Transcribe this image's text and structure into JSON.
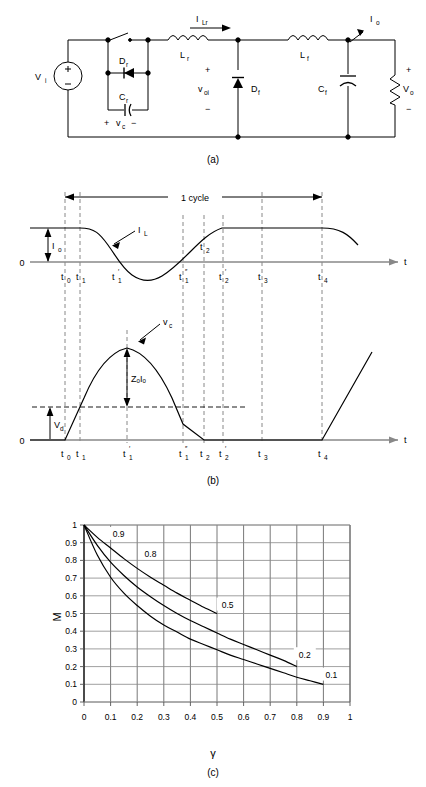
{
  "figure": {
    "panels": [
      {
        "id": "a",
        "caption": "(a)",
        "description": "circuit-schematic"
      },
      {
        "id": "b",
        "caption": "(b)",
        "description": "waveform-timing-diagram"
      },
      {
        "id": "c",
        "caption": "(c)",
        "description": "conversion-ratio-chart"
      }
    ]
  },
  "circuit": {
    "source_label": "Vᵢ",
    "switch_name": "switch",
    "components": [
      {
        "name": "Dᵣ",
        "label": "D",
        "sub": "r",
        "type": "diode"
      },
      {
        "name": "Cᵣ",
        "label": "C",
        "sub": "r",
        "type": "capacitor"
      },
      {
        "name": "Lᵣ",
        "label": "L",
        "sub": "r",
        "type": "inductor"
      },
      {
        "name": "Lғ",
        "label": "L",
        "sub": "f",
        "type": "inductor"
      },
      {
        "name": "Dғ",
        "label": "D",
        "sub": "f",
        "type": "diode"
      },
      {
        "name": "Cғ",
        "label": "C",
        "sub": "f",
        "type": "capacitor"
      }
    ],
    "labels": {
      "vi": "V",
      "vi_sub": "i",
      "dr": "D",
      "dr_sub": "r",
      "cr": "C",
      "cr_sub": "r",
      "vc_plus": "+",
      "vc": "v",
      "vc_sub": "c",
      "vc_minus": "−",
      "ilr": "I",
      "ilr_sub": "Lr",
      "lr": "L",
      "lr_sub": "r",
      "lf": "L",
      "lf_sub": "f",
      "voi": "v",
      "voi_sub": "oi",
      "df": "D",
      "df_sub": "f",
      "cf": "C",
      "cf_sub": "f",
      "io": "I",
      "io_sub": "o",
      "vo": "V",
      "vo_sub": "o",
      "plus": "+",
      "minus": "−"
    }
  },
  "waveforms": {
    "cycle_label": "1 cycle",
    "zero_label": "0",
    "time_axis_label": "t",
    "current_trace": {
      "name": "I",
      "sub": "L"
    },
    "current_amplitude": {
      "name": "I",
      "sub": "o"
    },
    "voltage_trace": {
      "name": "v",
      "sub": "c"
    },
    "voltage_peak": {
      "name": "Z",
      "sub1": "o",
      "name2": "I",
      "sub2": "o",
      "text": "ZₒIₒ"
    },
    "voltage_offset": {
      "name": "V",
      "sub": "d"
    },
    "time_marks": [
      {
        "id": "t0",
        "base": "t",
        "sub": "0",
        "prime": ""
      },
      {
        "id": "t1",
        "base": "t",
        "sub": "1",
        "prime": ""
      },
      {
        "id": "t1p",
        "base": "t",
        "sub": "1",
        "prime": "′"
      },
      {
        "id": "t1pp",
        "base": "t",
        "sub": "1",
        "prime": "″"
      },
      {
        "id": "t2",
        "base": "t",
        "sub": "2",
        "prime": ""
      },
      {
        "id": "t2p",
        "base": "t",
        "sub": "2",
        "prime": "′"
      },
      {
        "id": "t3",
        "base": "t",
        "sub": "3",
        "prime": ""
      },
      {
        "id": "t4",
        "base": "t",
        "sub": "4",
        "prime": ""
      }
    ]
  },
  "chart_data": {
    "type": "line",
    "title": "",
    "xlabel": "γ",
    "ylabel": "M",
    "xlim": [
      0,
      1
    ],
    "ylim": [
      0,
      1
    ],
    "grid": true,
    "legend_position": "inline-labels",
    "xticks": [
      "0",
      "0.1",
      "0.2",
      "0.3",
      "0.4",
      "0.5",
      "0.6",
      "0.7",
      "0.8",
      "0.9",
      "1"
    ],
    "yticks": [
      "0",
      "0.1",
      "0.2",
      "0.3",
      "0.4",
      "0.5",
      "0.6",
      "0.7",
      "0.8",
      "0.9",
      "1"
    ],
    "annotations": [
      {
        "text": "0.9",
        "x": 0.13,
        "y": 0.95
      },
      {
        "text": "0.8",
        "x": 0.25,
        "y": 0.84
      },
      {
        "text": "0.5",
        "x": 0.54,
        "y": 0.55
      },
      {
        "text": "0.2",
        "x": 0.83,
        "y": 0.27
      },
      {
        "text": "0.1",
        "x": 0.93,
        "y": 0.155
      }
    ],
    "series": [
      {
        "name": "0.9 / 0.5",
        "label": "0.5",
        "points": [
          [
            0.0,
            1.0
          ],
          [
            0.05,
            0.93
          ],
          [
            0.1,
            0.87
          ],
          [
            0.15,
            0.81
          ],
          [
            0.2,
            0.755
          ],
          [
            0.25,
            0.705
          ],
          [
            0.3,
            0.66
          ],
          [
            0.35,
            0.615
          ],
          [
            0.4,
            0.575
          ],
          [
            0.45,
            0.535
          ],
          [
            0.5,
            0.5
          ]
        ]
      },
      {
        "name": "0.8 / 0.2",
        "label": "0.2",
        "points": [
          [
            0.0,
            1.0
          ],
          [
            0.05,
            0.885
          ],
          [
            0.1,
            0.79
          ],
          [
            0.15,
            0.715
          ],
          [
            0.2,
            0.65
          ],
          [
            0.25,
            0.595
          ],
          [
            0.3,
            0.545
          ],
          [
            0.35,
            0.5
          ],
          [
            0.4,
            0.46
          ],
          [
            0.45,
            0.425
          ],
          [
            0.5,
            0.39
          ],
          [
            0.55,
            0.355
          ],
          [
            0.6,
            0.325
          ],
          [
            0.65,
            0.295
          ],
          [
            0.7,
            0.265
          ],
          [
            0.75,
            0.235
          ],
          [
            0.8,
            0.2
          ]
        ]
      },
      {
        "name": "0.1",
        "label": "0.1",
        "points": [
          [
            0.0,
            1.0
          ],
          [
            0.05,
            0.83
          ],
          [
            0.1,
            0.705
          ],
          [
            0.15,
            0.615
          ],
          [
            0.2,
            0.545
          ],
          [
            0.25,
            0.485
          ],
          [
            0.3,
            0.435
          ],
          [
            0.35,
            0.395
          ],
          [
            0.4,
            0.355
          ],
          [
            0.45,
            0.325
          ],
          [
            0.5,
            0.295
          ],
          [
            0.55,
            0.265
          ],
          [
            0.6,
            0.24
          ],
          [
            0.65,
            0.215
          ],
          [
            0.7,
            0.19
          ],
          [
            0.75,
            0.165
          ],
          [
            0.8,
            0.14
          ],
          [
            0.85,
            0.12
          ],
          [
            0.9,
            0.1
          ]
        ]
      }
    ]
  }
}
